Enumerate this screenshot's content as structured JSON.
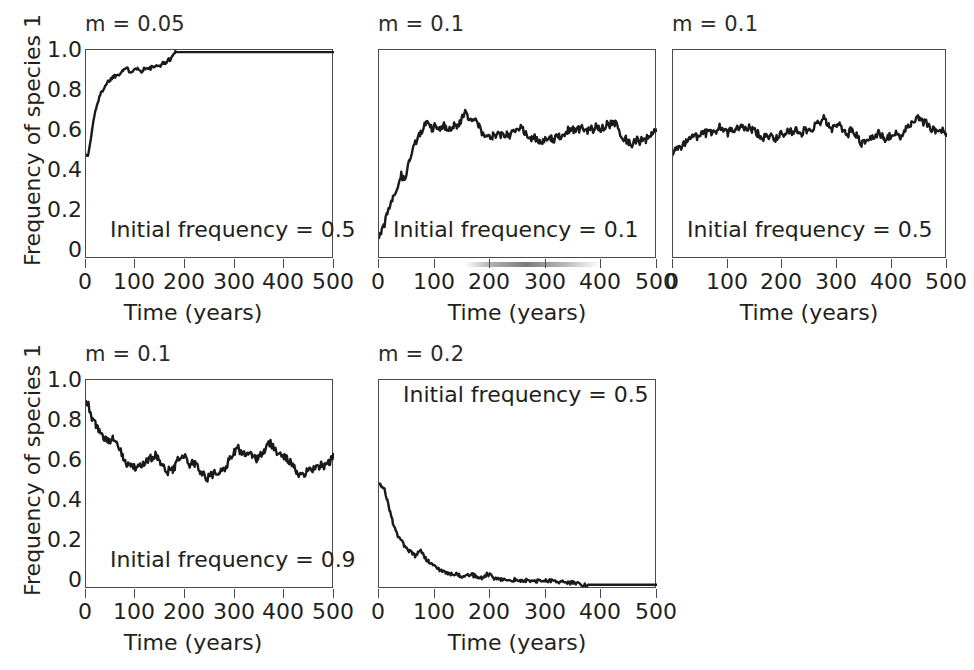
{
  "figure": {
    "background": "#ffffff",
    "line_color": "#1a1a1a",
    "axis_color": "#4a4a4a",
    "text_color": "#231f20"
  },
  "axis": {
    "xlabel": "Time (years)",
    "ylabel": "Frequency of species 1",
    "xticks": [
      "0",
      "100",
      "200",
      "300",
      "400",
      "500"
    ],
    "yticks": [
      "1.0",
      "0.8",
      "0.6",
      "0.4",
      "0.2",
      "0"
    ]
  },
  "chart_data": [
    {
      "type": "line",
      "title": "m = 0.05",
      "annotation": "Initial frequency = 0.5",
      "xlabel": "Time (years)",
      "ylabel": "Frequency of species 1",
      "xlim": [
        0,
        500
      ],
      "ylim": [
        0,
        1.0
      ],
      "xticks": [
        0,
        100,
        200,
        300,
        400,
        500
      ],
      "yticks": [
        0,
        0.2,
        0.4,
        0.6,
        0.8,
        1.0
      ],
      "show_ytick_labels": true,
      "show_yaxis_title": true,
      "grid": false,
      "legend": "none",
      "migration_rate": 0.05,
      "initial_frequency": 0.5,
      "x": [
        0,
        5,
        10,
        15,
        20,
        25,
        30,
        35,
        40,
        45,
        50,
        55,
        60,
        65,
        70,
        75,
        80,
        85,
        90,
        95,
        100,
        105,
        110,
        115,
        120,
        125,
        130,
        135,
        140,
        145,
        150,
        155,
        160,
        165,
        170,
        175,
        180,
        190,
        200,
        220,
        240,
        260,
        280,
        300,
        320,
        340,
        360,
        380,
        400,
        420,
        440,
        460,
        480,
        500
      ],
      "y": [
        0.5,
        0.5,
        0.58,
        0.66,
        0.72,
        0.76,
        0.79,
        0.815,
        0.835,
        0.85,
        0.862,
        0.872,
        0.878,
        0.885,
        0.895,
        0.905,
        0.912,
        0.905,
        0.898,
        0.905,
        0.918,
        0.908,
        0.898,
        0.905,
        0.915,
        0.908,
        0.912,
        0.922,
        0.915,
        0.922,
        0.93,
        0.935,
        0.94,
        0.948,
        0.958,
        0.972,
        0.99,
        0.99,
        0.99,
        0.99,
        0.99,
        0.99,
        0.99,
        0.99,
        0.99,
        0.99,
        0.99,
        0.99,
        0.99,
        0.99,
        0.99,
        0.99,
        0.99,
        0.99
      ]
    },
    {
      "type": "line",
      "title": "m = 0.1",
      "annotation": "Initial frequency = 0.1",
      "xlabel": "Time (years)",
      "ylabel": "Frequency of species 1",
      "xlim": [
        0,
        500
      ],
      "ylim": [
        0,
        1.0
      ],
      "xticks": [
        0,
        100,
        200,
        300,
        400,
        500
      ],
      "yticks": [
        0,
        0.2,
        0.4,
        0.6,
        0.8,
        1.0
      ],
      "show_ytick_labels": false,
      "show_yaxis_title": false,
      "grid": false,
      "legend": "none",
      "migration_rate": 0.1,
      "initial_frequency": 0.1,
      "x": [
        0,
        5,
        10,
        15,
        20,
        25,
        30,
        35,
        40,
        45,
        50,
        55,
        60,
        65,
        70,
        75,
        80,
        85,
        90,
        95,
        100,
        105,
        110,
        115,
        120,
        125,
        130,
        135,
        140,
        145,
        150,
        155,
        160,
        165,
        170,
        175,
        180,
        185,
        190,
        195,
        200,
        205,
        210,
        215,
        220,
        225,
        230,
        235,
        240,
        245,
        250,
        255,
        260,
        265,
        270,
        275,
        280,
        285,
        290,
        295,
        300,
        305,
        310,
        315,
        320,
        325,
        330,
        335,
        340,
        345,
        350,
        355,
        360,
        365,
        370,
        375,
        380,
        385,
        390,
        395,
        400,
        405,
        410,
        415,
        420,
        425,
        430,
        435,
        440,
        445,
        450,
        455,
        460,
        465,
        470,
        475,
        480,
        485,
        490,
        495,
        500
      ],
      "y": [
        0.1,
        0.13,
        0.17,
        0.22,
        0.26,
        0.3,
        0.33,
        0.36,
        0.4,
        0.38,
        0.41,
        0.48,
        0.52,
        0.56,
        0.58,
        0.6,
        0.64,
        0.66,
        0.64,
        0.62,
        0.64,
        0.63,
        0.62,
        0.64,
        0.63,
        0.62,
        0.63,
        0.64,
        0.63,
        0.65,
        0.68,
        0.7,
        0.68,
        0.66,
        0.65,
        0.66,
        0.64,
        0.6,
        0.58,
        0.59,
        0.57,
        0.59,
        0.58,
        0.6,
        0.59,
        0.58,
        0.6,
        0.59,
        0.61,
        0.6,
        0.62,
        0.63,
        0.62,
        0.6,
        0.58,
        0.57,
        0.58,
        0.57,
        0.56,
        0.57,
        0.58,
        0.57,
        0.58,
        0.57,
        0.59,
        0.58,
        0.59,
        0.6,
        0.62,
        0.61,
        0.62,
        0.61,
        0.62,
        0.63,
        0.62,
        0.61,
        0.63,
        0.62,
        0.64,
        0.63,
        0.62,
        0.63,
        0.65,
        0.64,
        0.66,
        0.65,
        0.63,
        0.6,
        0.58,
        0.57,
        0.56,
        0.55,
        0.56,
        0.57,
        0.56,
        0.58,
        0.57,
        0.59,
        0.6,
        0.61,
        0.62
      ]
    },
    {
      "type": "line",
      "title": "m = 0.1",
      "annotation": "Initial frequency = 0.5",
      "xlabel": "Time (years)",
      "ylabel": "Frequency of species 1",
      "xlim": [
        0,
        500
      ],
      "ylim": [
        0,
        1.0
      ],
      "xticks": [
        0,
        100,
        200,
        300,
        400,
        500
      ],
      "yticks": [
        0,
        0.2,
        0.4,
        0.6,
        0.8,
        1.0
      ],
      "show_ytick_labels": false,
      "show_yaxis_title": false,
      "grid": false,
      "legend": "none",
      "migration_rate": 0.1,
      "initial_frequency": 0.5,
      "x": [
        0,
        5,
        10,
        15,
        20,
        25,
        30,
        35,
        40,
        45,
        50,
        55,
        60,
        65,
        70,
        75,
        80,
        85,
        90,
        95,
        100,
        105,
        110,
        115,
        120,
        125,
        130,
        135,
        140,
        145,
        150,
        155,
        160,
        165,
        170,
        175,
        180,
        185,
        190,
        195,
        200,
        205,
        210,
        215,
        220,
        225,
        230,
        235,
        240,
        245,
        250,
        255,
        260,
        265,
        270,
        275,
        280,
        285,
        290,
        295,
        300,
        305,
        310,
        315,
        320,
        325,
        330,
        335,
        340,
        345,
        350,
        355,
        360,
        365,
        370,
        375,
        380,
        385,
        390,
        395,
        400,
        405,
        410,
        415,
        420,
        425,
        430,
        435,
        440,
        445,
        450,
        455,
        460,
        465,
        470,
        475,
        480,
        485,
        490,
        495,
        500
      ],
      "y": [
        0.5,
        0.52,
        0.54,
        0.53,
        0.55,
        0.57,
        0.58,
        0.6,
        0.59,
        0.58,
        0.6,
        0.61,
        0.6,
        0.62,
        0.61,
        0.6,
        0.62,
        0.63,
        0.62,
        0.61,
        0.6,
        0.62,
        0.61,
        0.63,
        0.62,
        0.64,
        0.63,
        0.62,
        0.63,
        0.62,
        0.61,
        0.6,
        0.59,
        0.58,
        0.6,
        0.59,
        0.58,
        0.57,
        0.58,
        0.6,
        0.59,
        0.61,
        0.62,
        0.61,
        0.6,
        0.62,
        0.61,
        0.6,
        0.62,
        0.61,
        0.63,
        0.62,
        0.64,
        0.65,
        0.66,
        0.68,
        0.66,
        0.64,
        0.62,
        0.63,
        0.65,
        0.64,
        0.62,
        0.61,
        0.6,
        0.62,
        0.61,
        0.59,
        0.57,
        0.55,
        0.56,
        0.58,
        0.57,
        0.59,
        0.58,
        0.6,
        0.59,
        0.58,
        0.57,
        0.59,
        0.58,
        0.6,
        0.59,
        0.58,
        0.6,
        0.62,
        0.63,
        0.65,
        0.67,
        0.68,
        0.67,
        0.65,
        0.66,
        0.64,
        0.63,
        0.62,
        0.61,
        0.6,
        0.62,
        0.61,
        0.6
      ]
    },
    {
      "type": "line",
      "title": "m = 0.1",
      "annotation": "Initial frequency = 0.9",
      "xlabel": "Time (years)",
      "ylabel": "Frequency of species 1",
      "xlim": [
        0,
        500
      ],
      "ylim": [
        0,
        1.0
      ],
      "xticks": [
        0,
        100,
        200,
        300,
        400,
        500
      ],
      "yticks": [
        0,
        0.2,
        0.4,
        0.6,
        0.8,
        1.0
      ],
      "show_ytick_labels": true,
      "show_yaxis_title": true,
      "grid": false,
      "legend": "none",
      "migration_rate": 0.1,
      "initial_frequency": 0.9,
      "x": [
        0,
        5,
        10,
        15,
        20,
        25,
        30,
        35,
        40,
        45,
        50,
        55,
        60,
        65,
        70,
        75,
        80,
        85,
        90,
        95,
        100,
        105,
        110,
        115,
        120,
        125,
        130,
        135,
        140,
        145,
        150,
        155,
        160,
        165,
        170,
        175,
        180,
        185,
        190,
        195,
        200,
        205,
        210,
        215,
        220,
        225,
        230,
        235,
        240,
        245,
        250,
        255,
        260,
        265,
        270,
        275,
        280,
        285,
        290,
        295,
        300,
        305,
        310,
        315,
        320,
        325,
        330,
        335,
        340,
        345,
        350,
        355,
        360,
        365,
        370,
        375,
        380,
        385,
        390,
        395,
        400,
        405,
        410,
        415,
        420,
        425,
        430,
        435,
        440,
        445,
        450,
        455,
        460,
        465,
        470,
        475,
        480,
        485,
        490,
        495,
        500
      ],
      "y": [
        0.9,
        0.88,
        0.82,
        0.8,
        0.78,
        0.76,
        0.74,
        0.73,
        0.72,
        0.71,
        0.7,
        0.72,
        0.7,
        0.68,
        0.66,
        0.63,
        0.6,
        0.59,
        0.6,
        0.59,
        0.58,
        0.6,
        0.59,
        0.61,
        0.6,
        0.62,
        0.63,
        0.62,
        0.64,
        0.63,
        0.61,
        0.58,
        0.57,
        0.56,
        0.58,
        0.57,
        0.59,
        0.62,
        0.63,
        0.64,
        0.63,
        0.6,
        0.58,
        0.61,
        0.6,
        0.58,
        0.56,
        0.55,
        0.54,
        0.53,
        0.55,
        0.54,
        0.56,
        0.55,
        0.57,
        0.56,
        0.58,
        0.6,
        0.62,
        0.64,
        0.66,
        0.68,
        0.66,
        0.64,
        0.65,
        0.66,
        0.65,
        0.64,
        0.63,
        0.62,
        0.63,
        0.65,
        0.66,
        0.68,
        0.7,
        0.69,
        0.67,
        0.65,
        0.64,
        0.63,
        0.64,
        0.62,
        0.61,
        0.6,
        0.58,
        0.56,
        0.55,
        0.54,
        0.55,
        0.56,
        0.57,
        0.58,
        0.57,
        0.59,
        0.58,
        0.6,
        0.59,
        0.61,
        0.6,
        0.62,
        0.63
      ]
    },
    {
      "type": "line",
      "title": "m = 0.2",
      "annotation": "Initial frequency = 0.5",
      "xlabel": "Time (years)",
      "ylabel": "Frequency of species 1",
      "xlim": [
        0,
        500
      ],
      "ylim": [
        0,
        1.0
      ],
      "xticks": [
        0,
        100,
        200,
        300,
        400,
        500
      ],
      "yticks": [
        0,
        0.2,
        0.4,
        0.6,
        0.8,
        1.0
      ],
      "show_ytick_labels": false,
      "show_yaxis_title": false,
      "grid": false,
      "legend": "none",
      "migration_rate": 0.2,
      "initial_frequency": 0.5,
      "x": [
        0,
        5,
        10,
        15,
        20,
        25,
        30,
        35,
        40,
        45,
        50,
        55,
        60,
        65,
        70,
        75,
        80,
        85,
        90,
        95,
        100,
        105,
        110,
        115,
        120,
        125,
        130,
        135,
        140,
        145,
        150,
        155,
        160,
        165,
        170,
        175,
        180,
        185,
        190,
        195,
        200,
        205,
        210,
        215,
        220,
        225,
        230,
        235,
        240,
        245,
        250,
        255,
        260,
        265,
        270,
        275,
        280,
        285,
        290,
        295,
        300,
        305,
        310,
        315,
        320,
        325,
        330,
        335,
        340,
        345,
        350,
        355,
        360,
        365,
        370,
        380,
        400,
        420,
        440,
        460,
        480,
        500
      ],
      "y": [
        0.5,
        0.49,
        0.48,
        0.42,
        0.37,
        0.32,
        0.28,
        0.25,
        0.23,
        0.21,
        0.2,
        0.18,
        0.17,
        0.16,
        0.17,
        0.18,
        0.16,
        0.14,
        0.13,
        0.12,
        0.11,
        0.1,
        0.09,
        0.085,
        0.08,
        0.075,
        0.07,
        0.072,
        0.068,
        0.065,
        0.06,
        0.065,
        0.07,
        0.068,
        0.065,
        0.06,
        0.058,
        0.055,
        0.06,
        0.072,
        0.065,
        0.055,
        0.05,
        0.048,
        0.046,
        0.044,
        0.045,
        0.043,
        0.042,
        0.044,
        0.042,
        0.04,
        0.042,
        0.041,
        0.04,
        0.042,
        0.04,
        0.038,
        0.04,
        0.042,
        0.044,
        0.04,
        0.038,
        0.036,
        0.034,
        0.032,
        0.034,
        0.03,
        0.032,
        0.03,
        0.028,
        0.026,
        0.024,
        0.022,
        0.02,
        0.02,
        0.02,
        0.02,
        0.02,
        0.02,
        0.02,
        0.02
      ]
    }
  ]
}
